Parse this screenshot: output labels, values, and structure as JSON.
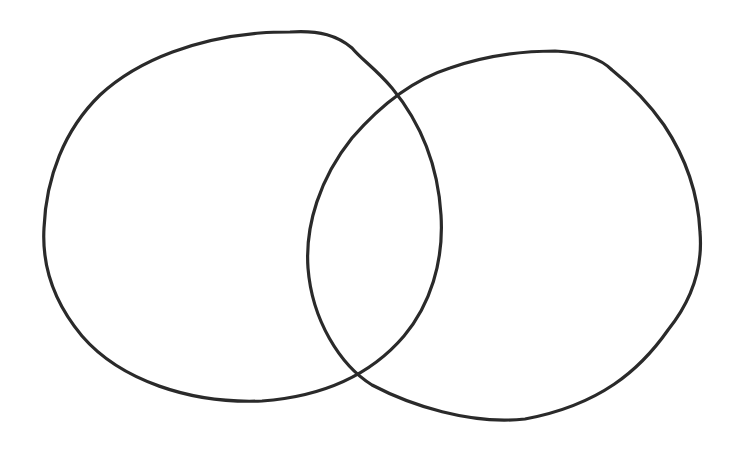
{
  "diagram": {
    "type": "venn",
    "sets": [
      {
        "id": "left",
        "label": ""
      },
      {
        "id": "right",
        "label": ""
      }
    ],
    "intersection_label": "",
    "style": {
      "background": "#ffffff",
      "stroke": "#2a2a2a",
      "stroke_width": 3.2
    }
  }
}
